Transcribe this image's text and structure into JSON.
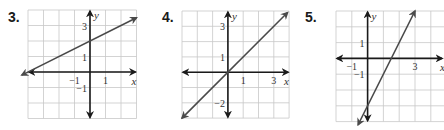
{
  "chart_data": [
    {
      "type": "line",
      "problem_number": "3.",
      "title": "",
      "xlabel": "x",
      "ylabel": "y",
      "xlim": [
        -4,
        3
      ],
      "ylim": [
        -3,
        4
      ],
      "grid": true,
      "x_tick_labels": [
        {
          "value": -1,
          "label": "−1"
        },
        {
          "value": 1,
          "label": "1"
        }
      ],
      "y_tick_labels": [
        {
          "value": 3,
          "label": "3"
        },
        {
          "value": 1,
          "label": "1"
        },
        {
          "value": -1,
          "label": "−1"
        }
      ],
      "series": [
        {
          "name": "line",
          "equation": "y = 0.5x + 2",
          "slope": 0.5,
          "intercept": 2,
          "x_range": [
            -4.4,
            3.0
          ],
          "points": [
            [
              -4,
              0
            ],
            [
              0,
              2
            ],
            [
              2,
              3
            ]
          ]
        }
      ]
    },
    {
      "type": "line",
      "problem_number": "4.",
      "title": "",
      "xlabel": "x",
      "ylabel": "y",
      "xlim": [
        -3,
        4
      ],
      "ylim": [
        -3,
        4
      ],
      "grid": true,
      "x_tick_labels": [
        {
          "value": 1,
          "label": "1"
        },
        {
          "value": 3,
          "label": "3"
        }
      ],
      "y_tick_labels": [
        {
          "value": 3,
          "label": "3"
        },
        {
          "value": 1,
          "label": "1"
        },
        {
          "value": -2,
          "label": "−2"
        }
      ],
      "series": [
        {
          "name": "line",
          "equation": "y = x",
          "slope": 1,
          "intercept": 0,
          "x_range": [
            -3,
            3.9
          ],
          "points": [
            [
              -3,
              -3
            ],
            [
              0,
              0
            ],
            [
              3,
              3
            ]
          ]
        }
      ]
    },
    {
      "type": "line",
      "problem_number": "5.",
      "title": "",
      "xlabel": "x",
      "ylabel": "y",
      "xlim": [
        -2,
        5
      ],
      "ylim": [
        -4,
        3
      ],
      "grid": true,
      "x_tick_labels": [
        {
          "value": -1,
          "label": "−1"
        },
        {
          "value": 3,
          "label": "3"
        }
      ],
      "y_tick_labels": [
        {
          "value": 1,
          "label": "1"
        },
        {
          "value": -1,
          "label": "−1"
        }
      ],
      "series": [
        {
          "name": "line",
          "equation": "y = 2x - 3",
          "slope": 2,
          "intercept": -3,
          "x_range": [
            -0.6,
            3.0
          ],
          "points": [
            [
              0,
              -3
            ],
            [
              1.5,
              0
            ],
            [
              3,
              3
            ]
          ]
        }
      ]
    }
  ],
  "layout": [
    {
      "left": 0,
      "label_x": 8,
      "label_y": 10,
      "grid_x0": 28,
      "grid_y0": 10,
      "cell": 15.5
    },
    {
      "left": 150,
      "label_x": 162,
      "label_y": 10,
      "grid_x0": 182,
      "grid_y0": 11,
      "cell": 15.3
    },
    {
      "left": 294,
      "label_x": 305,
      "label_y": 10,
      "grid_x0": 336,
      "grid_y0": 11,
      "cell": 15.8
    }
  ],
  "colors": {
    "grid": "#c8c8c8",
    "axis": "#1a1a1a",
    "line": "#4a4a4a"
  }
}
